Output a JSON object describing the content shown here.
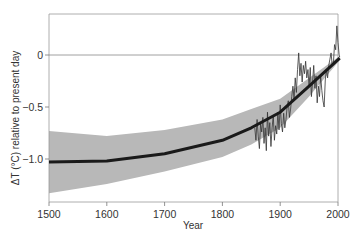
{
  "chart_data": {
    "type": "line",
    "title": "",
    "xlabel": "Year",
    "ylabel": "ΔT (°C) relative to present day",
    "xlim": [
      1500,
      2005
    ],
    "ylim": [
      -1.38,
      0.4
    ],
    "x_ticks": [
      1500,
      1600,
      1700,
      1800,
      1900,
      2000
    ],
    "x_tick_labels": [
      "1500",
      "1600",
      "1700",
      "1800",
      "1900",
      "2000"
    ],
    "y_ticks": [
      0,
      -0.5,
      -1.0
    ],
    "y_tick_labels": [
      "0",
      "−0.5",
      "−1.0"
    ],
    "grid": false,
    "reference_line": 0,
    "series": [
      {
        "name": "Reconstruction (smoothed)",
        "style": "thick line",
        "color": "#1a1a1a",
        "x": [
          1500,
          1600,
          1700,
          1800,
          1850,
          1900,
          1950,
          2005
        ],
        "values": [
          -1.03,
          -1.02,
          -0.95,
          -0.82,
          -0.7,
          -0.55,
          -0.3,
          -0.03
        ]
      },
      {
        "name": "Uncertainty band",
        "style": "shaded area",
        "color": "#b8b8b8",
        "x": [
          1500,
          1600,
          1700,
          1800,
          1850,
          1900,
          1950,
          2005
        ],
        "upper": [
          -0.73,
          -0.78,
          -0.72,
          -0.62,
          -0.52,
          -0.42,
          -0.22,
          -0.01
        ],
        "lower": [
          -1.33,
          -1.24,
          -1.12,
          -0.98,
          -0.86,
          -0.7,
          -0.4,
          -0.05
        ]
      },
      {
        "name": "Instrumental record (annual)",
        "style": "thin line",
        "color": "#333333",
        "x": [
          1856,
          1858,
          1860,
          1862,
          1864,
          1866,
          1868,
          1870,
          1872,
          1874,
          1876,
          1878,
          1880,
          1882,
          1884,
          1886,
          1888,
          1890,
          1892,
          1894,
          1896,
          1898,
          1900,
          1902,
          1904,
          1906,
          1908,
          1910,
          1912,
          1914,
          1916,
          1918,
          1920,
          1922,
          1924,
          1926,
          1928,
          1930,
          1932,
          1934,
          1936,
          1938,
          1940,
          1942,
          1944,
          1946,
          1948,
          1950,
          1952,
          1954,
          1956,
          1958,
          1960,
          1962,
          1964,
          1966,
          1968,
          1970,
          1972,
          1974,
          1976,
          1978,
          1980,
          1982,
          1984,
          1986,
          1988,
          1990,
          1992,
          1994,
          1996,
          1998,
          2000,
          2002,
          2004
        ],
        "values": [
          -0.7,
          -0.82,
          -0.62,
          -0.78,
          -0.9,
          -0.66,
          -0.74,
          -0.6,
          -0.85,
          -0.7,
          -0.92,
          -0.55,
          -0.78,
          -0.65,
          -0.88,
          -0.7,
          -0.58,
          -0.82,
          -0.68,
          -0.76,
          -0.55,
          -0.72,
          -0.48,
          -0.66,
          -0.74,
          -0.56,
          -0.7,
          -0.62,
          -0.5,
          -0.44,
          -0.6,
          -0.52,
          -0.4,
          -0.3,
          -0.42,
          -0.22,
          -0.36,
          -0.14,
          0.02,
          -0.2,
          -0.08,
          -0.26,
          -0.1,
          -0.18,
          -0.06,
          -0.22,
          -0.14,
          -0.3,
          -0.12,
          -0.4,
          -0.26,
          -0.1,
          -0.32,
          -0.2,
          -0.46,
          -0.3,
          -0.4,
          -0.2,
          -0.34,
          -0.44,
          -0.5,
          -0.24,
          -0.14,
          -0.22,
          -0.1,
          -0.04,
          0.02,
          -0.1,
          -0.08,
          0.1,
          0.05,
          0.28,
          0.12,
          0.0,
          -0.02
        ]
      }
    ]
  }
}
